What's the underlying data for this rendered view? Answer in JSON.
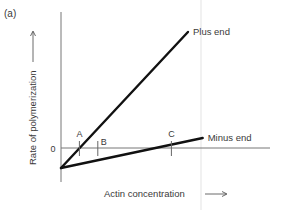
{
  "panel_label": "(a)",
  "chart_data": {
    "type": "line",
    "title": "",
    "xlabel": "Actin concentration",
    "ylabel": "Rate of polymerization",
    "y_zero_label": "0",
    "xlim": [
      0,
      10
    ],
    "ylim": [
      -1,
      6
    ],
    "series": [
      {
        "name": "Plus end",
        "x": [
          0,
          6.9
        ],
        "y": [
          -1,
          5.8
        ]
      },
      {
        "name": "Minus end",
        "x": [
          0,
          7.7
        ],
        "y": [
          -1,
          0.5
        ]
      }
    ],
    "markers": [
      {
        "label": "A",
        "x": 1.0
      },
      {
        "label": "B",
        "x": 2.0
      },
      {
        "label": "C",
        "x": 6.0
      }
    ]
  }
}
